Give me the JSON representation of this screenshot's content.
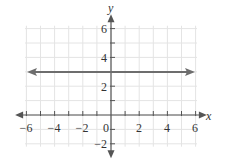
{
  "chart_data": {
    "type": "line",
    "title": "",
    "xlabel": "x",
    "ylabel": "y",
    "xlim": [
      -6,
      6
    ],
    "ylim": [
      -2,
      6
    ],
    "grid": true,
    "x_ticks": [
      -6,
      -4,
      -2,
      0,
      2,
      4,
      6
    ],
    "y_ticks": [
      -2,
      2,
      4,
      6
    ],
    "series": [
      {
        "name": "y = 3",
        "x": [
          -6,
          6
        ],
        "y": [
          3,
          3
        ],
        "color": "#6d6d6d",
        "arrows_both_ends": true
      }
    ]
  },
  "labels": {
    "x_axis": "x",
    "y_axis": "y",
    "x_ticks": [
      "−6",
      "−4",
      "−2",
      "0",
      "2",
      "4",
      "6"
    ],
    "y_ticks": [
      "6",
      "4",
      "2",
      "−2"
    ]
  },
  "colors": {
    "grid": "#e4e4e4",
    "axis": "#555555",
    "line": "#6d6d6d"
  }
}
